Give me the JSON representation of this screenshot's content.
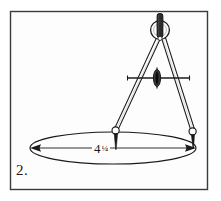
{
  "figure": {
    "label": "2.",
    "caption_number": "2",
    "style": "black-and-white-line-drawing",
    "border": {
      "present": true,
      "color": "#333333",
      "inner_background": "#fdfdfd",
      "rect": {
        "x": 10,
        "y": 11,
        "width": 198,
        "height": 179
      }
    },
    "dimension": {
      "value_whole": "4",
      "value_fraction": "1/4",
      "value_display": "4 1/4",
      "numerator": "1",
      "denominator": "4",
      "line_style": "double-arrow-leader",
      "arrow_left": "left-arrowhead",
      "arrow_right": "right-arrowhead"
    },
    "ellipse": {
      "center_x": 113,
      "center_y": 148,
      "radius_x": 83,
      "radius_y": 16,
      "stroke": "#1a1a1a"
    },
    "compass": {
      "pivot_x": 160,
      "pivot_y": 40,
      "handle_label": "knurled-handle",
      "hinge_label": "pivot-ring",
      "crossbar_label": "adjustment-crossbar",
      "thumbwheel_label": "thumb-nut",
      "left_leg_tip_x": 114,
      "left_leg_tip_y": 132,
      "right_leg_tip_x": 193,
      "right_leg_tip_y": 135,
      "stroke": "#1c1c1c"
    }
  }
}
